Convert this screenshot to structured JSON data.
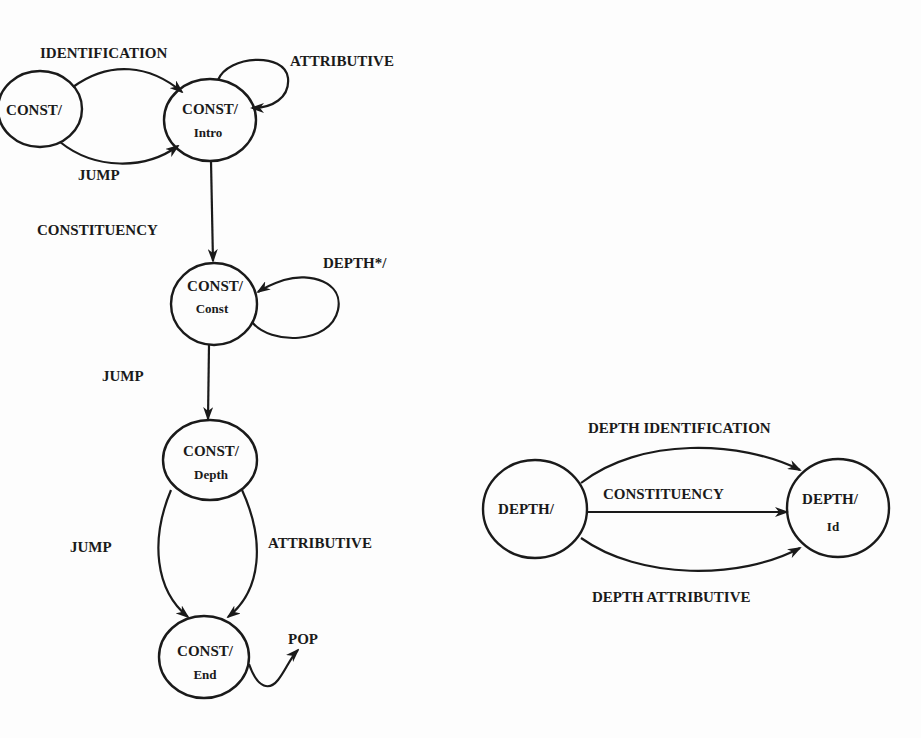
{
  "diagram": {
    "type": "state-transition-network",
    "colors": {
      "ink": "#1a1a1a",
      "background": "#fdfdfd"
    },
    "nodes": [
      {
        "id": "const",
        "line1": "CONST/",
        "line2": ""
      },
      {
        "id": "const_intro",
        "line1": "CONST/",
        "line2": "Intro"
      },
      {
        "id": "const_const",
        "line1": "CONST/",
        "line2": "Const"
      },
      {
        "id": "const_depth",
        "line1": "CONST/",
        "line2": "Depth"
      },
      {
        "id": "const_end",
        "line1": "CONST/",
        "line2": "End"
      },
      {
        "id": "depth",
        "line1": "DEPTH/",
        "line2": ""
      },
      {
        "id": "depth_id",
        "line1": "DEPTH/",
        "line2": "Id"
      }
    ],
    "edges": [
      {
        "from": "const",
        "to": "const_intro",
        "label": "IDENTIFICATION"
      },
      {
        "from": "const",
        "to": "const_intro",
        "label": "JUMP"
      },
      {
        "from": "const_intro",
        "to": "const_intro",
        "label": "ATTRIBUTIVE"
      },
      {
        "from": "const_intro",
        "to": "const_const",
        "label": "CONSTITUENCY"
      },
      {
        "from": "const_const",
        "to": "const_const",
        "label": "DEPTH*/"
      },
      {
        "from": "const_const",
        "to": "const_depth",
        "label": "JUMP"
      },
      {
        "from": "const_depth",
        "to": "const_end",
        "label": "JUMP"
      },
      {
        "from": "const_depth",
        "to": "const_end",
        "label": "ATTRIBUTIVE"
      },
      {
        "from": "const_end",
        "to": "exit",
        "label": "POP"
      },
      {
        "from": "depth",
        "to": "depth_id",
        "label": "DEPTH IDENTIFICATION"
      },
      {
        "from": "depth",
        "to": "depth_id",
        "label": "CONSTITUENCY"
      },
      {
        "from": "depth",
        "to": "depth_id",
        "label": "DEPTH ATTRIBUTIVE"
      }
    ]
  }
}
